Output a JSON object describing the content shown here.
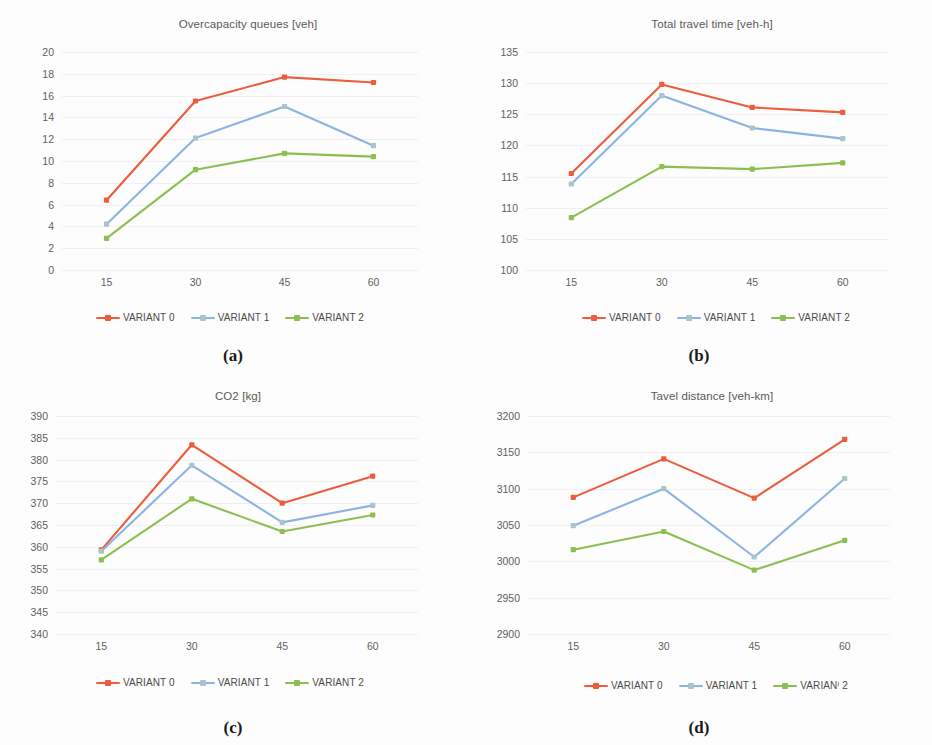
{
  "figure": {
    "background": "#fdfdfd",
    "series_colors": {
      "VARIANT 0": "#ed5c3c",
      "VARIANT 1": "#8cb4e2",
      "VARIANT 2": "#8cbf52"
    },
    "panels": [
      {
        "caption": "(a)"
      },
      {
        "caption": "(b)"
      },
      {
        "caption": "(c)"
      },
      {
        "caption": "(d)"
      }
    ]
  },
  "chart_data": [
    {
      "id": "a",
      "type": "line",
      "title": "Overcapacity queues [veh]",
      "xlabel": "",
      "ylabel": "",
      "categories": [
        "15",
        "30",
        "45",
        "60"
      ],
      "x": [
        15,
        30,
        45,
        60
      ],
      "yticks": [
        0,
        2,
        4,
        6,
        8,
        10,
        12,
        14,
        16,
        18,
        20
      ],
      "ytick_labels": [
        "0",
        "2",
        "4",
        "6",
        "8",
        "10",
        "12",
        "14",
        "16",
        "18",
        "20"
      ],
      "ylim": [
        0,
        20
      ],
      "grid": true,
      "legend_position": "bottom",
      "series": [
        {
          "name": "VARIANT 0",
          "color": "#ed5c3c",
          "values": [
            6.4,
            15.5,
            17.7,
            17.2
          ]
        },
        {
          "name": "VARIANT 1",
          "color": "#8cb4e2",
          "values": [
            4.2,
            12.1,
            15.0,
            11.4
          ]
        },
        {
          "name": "VARIANT 2",
          "color": "#8cbf52",
          "values": [
            2.9,
            9.2,
            10.7,
            10.4
          ]
        }
      ]
    },
    {
      "id": "b",
      "type": "line",
      "title": "Total travel time [veh-h]",
      "xlabel": "",
      "ylabel": "",
      "categories": [
        "15",
        "30",
        "45",
        "60"
      ],
      "x": [
        15,
        30,
        45,
        60
      ],
      "yticks": [
        100,
        105,
        110,
        115,
        120,
        125,
        130,
        135
      ],
      "ytick_labels": [
        "100",
        "105",
        "110",
        "115",
        "120",
        "125",
        "130",
        "135"
      ],
      "ylim": [
        100,
        135
      ],
      "grid": true,
      "legend_position": "bottom",
      "series": [
        {
          "name": "VARIANT 0",
          "color": "#ed5c3c",
          "values": [
            115.5,
            129.8,
            126.1,
            125.3
          ]
        },
        {
          "name": "VARIANT 1",
          "color": "#8cb4e2",
          "values": [
            113.8,
            128.0,
            122.8,
            121.1
          ]
        },
        {
          "name": "VARIANT 2",
          "color": "#8cbf52",
          "values": [
            108.4,
            116.6,
            116.2,
            117.2
          ]
        }
      ]
    },
    {
      "id": "c",
      "type": "line",
      "title": "CO2 [kg]",
      "xlabel": "",
      "ylabel": "",
      "categories": [
        "15",
        "30",
        "45",
        "60"
      ],
      "x": [
        15,
        30,
        45,
        60
      ],
      "yticks": [
        340,
        345,
        350,
        355,
        360,
        365,
        370,
        375,
        380,
        385,
        390
      ],
      "ytick_labels": [
        "340",
        "345",
        "350",
        "355",
        "360",
        "365",
        "370",
        "375",
        "380",
        "385",
        "390"
      ],
      "ylim": [
        340,
        390
      ],
      "grid": true,
      "legend_position": "bottom",
      "series": [
        {
          "name": "VARIANT 0",
          "color": "#ed5c3c",
          "values": [
            359.3,
            383.4,
            370.0,
            376.2
          ]
        },
        {
          "name": "VARIANT 1",
          "color": "#8cb4e2",
          "values": [
            359.0,
            378.7,
            365.6,
            369.5
          ]
        },
        {
          "name": "VARIANT 2",
          "color": "#8cbf52",
          "values": [
            357.0,
            371.0,
            363.5,
            367.3
          ]
        }
      ]
    },
    {
      "id": "d",
      "type": "line",
      "title": "Tavel distance [veh-km]",
      "xlabel": "",
      "ylabel": "",
      "categories": [
        "15",
        "30",
        "45",
        "60"
      ],
      "x": [
        15,
        30,
        45,
        60
      ],
      "yticks": [
        2900,
        2950,
        3000,
        3050,
        3100,
        3150,
        3200
      ],
      "ytick_labels": [
        "2900",
        "2950",
        "3000",
        "3050",
        "3100",
        "3150",
        "3200"
      ],
      "ylim": [
        2900,
        3200
      ],
      "grid": true,
      "legend_position": "bottom",
      "legend_labels": [
        "VARIANT 0",
        "VARIANT 1",
        "VARIAN⁾ 2"
      ],
      "series": [
        {
          "name": "VARIANT 0",
          "color": "#ed5c3c",
          "values": [
            3088,
            3141,
            3087,
            3168
          ]
        },
        {
          "name": "VARIANT 1",
          "color": "#8cb4e2",
          "values": [
            3049,
            3100,
            3006,
            3114
          ]
        },
        {
          "name": "VARIANT 2",
          "color": "#8cbf52",
          "values": [
            3016,
            3041,
            2988,
            3029
          ]
        }
      ]
    }
  ]
}
